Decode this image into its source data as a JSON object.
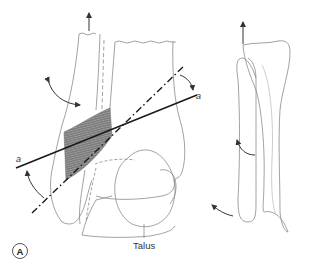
{
  "figure": {
    "panel_label": "A",
    "labels": {
      "axis_right": "a",
      "axis_left": "a",
      "talus": "Talus"
    },
    "colors": {
      "outline": "#8a8a8a",
      "axis": "#1a1a1a",
      "arrow": "#333333",
      "hatch_fill": "#7d7d7d",
      "hatch_line": "#a8a8a8",
      "background": "#ffffff"
    },
    "elements": [
      "tibia-outline",
      "fibula-outline",
      "talus-outline",
      "syndesmosis-hatched-region",
      "transmalleolar-axis-solid",
      "bimalleolar-axis-dash-dot",
      "fibula-proximal-translation-arrow",
      "fibula-rotation-arrow",
      "axis-angle-arrows",
      "lateral-view-tibia-fibula"
    ]
  }
}
